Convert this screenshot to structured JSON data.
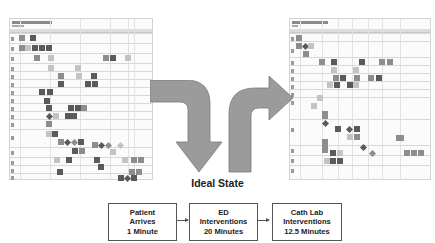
{
  "left_map": {
    "name": "current-state-process-map",
    "lanes": 16
  },
  "right_map": {
    "name": "ideal-state-process-map",
    "lanes": 12
  },
  "transition_label": "Ideal State",
  "colors": {
    "arrow_fill": "#9b9b9b",
    "arrow_stroke": "#7a7a7a",
    "box_border": "#555555",
    "text": "#222222"
  },
  "flow": {
    "steps": [
      {
        "lines": [
          "Patient",
          "Arrives",
          "1 Minute"
        ]
      },
      {
        "lines": [
          "ED",
          "Interventions",
          "20 Minutes"
        ]
      },
      {
        "lines": [
          "Cath Lab",
          "Interventions",
          "12.5 Minutes"
        ]
      }
    ]
  }
}
